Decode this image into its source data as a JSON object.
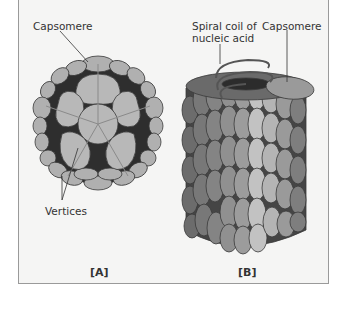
{
  "figure": {
    "panel_a": {
      "id": "[A]",
      "labels": {
        "capsomere": "Capsomere",
        "vertices": "Vertices"
      }
    },
    "panel_b": {
      "id": "[B]",
      "labels": {
        "spiral_line1": "Spiral coil of",
        "spiral_line2": "nucleic acid",
        "capsomere": "Capsomere"
      }
    },
    "colors": {
      "background": "#f5f5f4",
      "capsomere_fill": "#b4b4b4",
      "outline": "#3c3c3c",
      "dark_gap": "#2a2a2a"
    }
  }
}
